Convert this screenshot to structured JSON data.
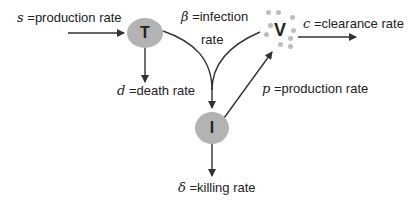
{
  "diagram": {
    "type": "viral-dynamics-compartment-model",
    "nodes": {
      "T": {
        "label": "T",
        "fill": "#b3b3b3"
      },
      "I": {
        "label": "I",
        "fill": "#b3b3b3"
      },
      "V": {
        "label": "V",
        "dot_color": "#bdbdbd"
      }
    },
    "labels": {
      "s": {
        "symbol": "s",
        "text": " =production rate"
      },
      "d": {
        "symbol": "d",
        "text": " =death rate"
      },
      "beta": {
        "symbol": "β",
        "text": " =infection",
        "line2": "rate"
      },
      "c": {
        "symbol": "c",
        "text": " =clearance rate"
      },
      "p": {
        "symbol": "p",
        "text": " =production rate"
      },
      "delta": {
        "symbol": "δ",
        "text": " =killing rate"
      }
    },
    "edges": [
      {
        "from": "source",
        "to": "T",
        "label": "s"
      },
      {
        "from": "T",
        "to": "sink",
        "label": "d"
      },
      {
        "from": "T",
        "to": "I",
        "label": "beta",
        "joined_with": "V"
      },
      {
        "from": "V",
        "to": "I",
        "label": "beta",
        "joined_with": "T"
      },
      {
        "from": "I",
        "to": "V",
        "label": "p"
      },
      {
        "from": "V",
        "to": "sink",
        "label": "c"
      },
      {
        "from": "I",
        "to": "sink",
        "label": "delta"
      }
    ],
    "colors": {
      "line": "#333333",
      "node": "#b3b3b3",
      "text": "#222222"
    }
  }
}
